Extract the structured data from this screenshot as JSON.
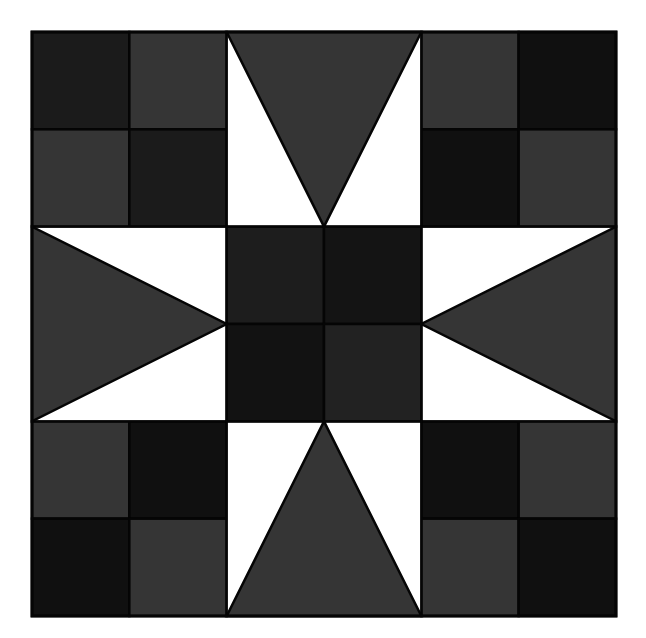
{
  "canvas": {
    "width": 646,
    "height": 638,
    "background": "#ffffff"
  },
  "block": {
    "x": 32,
    "y": 32,
    "size": 584,
    "grid": 3,
    "seam_color": "#050505",
    "seam_width": 2.5
  },
  "colors": {
    "gray": "#353535",
    "dark": "#1b1b1b",
    "darker": "#101010",
    "white": "#ffffff",
    "center_tl": "#1d1d1d",
    "center_tr": "#141414",
    "center_bl": "#121212",
    "center_br": "#222222"
  },
  "corners": [
    {
      "name": "corner-top-left",
      "col": 0,
      "row": 0,
      "patches": [
        "dark",
        "gray",
        "gray",
        "dark"
      ]
    },
    {
      "name": "corner-top-right",
      "col": 2,
      "row": 0,
      "patches": [
        "gray",
        "darker",
        "darker",
        "gray"
      ]
    },
    {
      "name": "corner-bottom-left",
      "col": 0,
      "row": 2,
      "patches": [
        "gray",
        "darker",
        "darker",
        "gray"
      ]
    },
    {
      "name": "corner-bottom-right",
      "col": 2,
      "row": 2,
      "patches": [
        "darker",
        "gray",
        "gray",
        "darker"
      ]
    }
  ],
  "star_points": [
    {
      "name": "star-point-top",
      "col": 1,
      "row": 0,
      "direction": "down",
      "fill": "gray"
    },
    {
      "name": "star-point-left",
      "col": 0,
      "row": 1,
      "direction": "right",
      "fill": "gray"
    },
    {
      "name": "star-point-right",
      "col": 2,
      "row": 1,
      "direction": "left",
      "fill": "gray"
    },
    {
      "name": "star-point-bottom",
      "col": 1,
      "row": 2,
      "direction": "up",
      "fill": "gray"
    }
  ],
  "center": {
    "col": 1,
    "row": 1,
    "patches": [
      "center_tl",
      "center_tr",
      "center_bl",
      "center_br"
    ]
  }
}
